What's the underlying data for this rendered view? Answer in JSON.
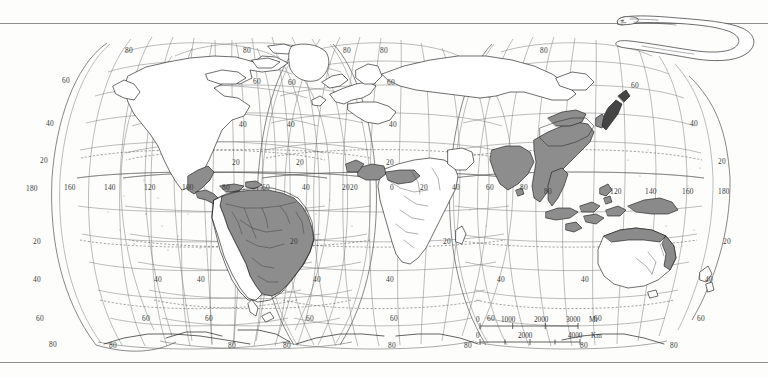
{
  "figure": {
    "kind": "world-distribution-map",
    "projection_name": "interrupted homolosine (Goode-style)",
    "subject_illustration": "eel"
  },
  "scale_bar": {
    "miles": {
      "unit_label": "Mi",
      "ticks": [
        "0",
        "1000",
        "2000",
        "3000"
      ]
    },
    "kilometers": {
      "unit_label": "Km",
      "ticks": [
        "0",
        "2000",
        "4000"
      ]
    }
  },
  "graticule": {
    "latitude_labels": [
      "80",
      "60",
      "40",
      "20",
      "20",
      "40",
      "60",
      "80"
    ],
    "longitude_labels_americas": [
      "180",
      "160",
      "140",
      "120",
      "100",
      "80",
      "60",
      "40",
      "20"
    ],
    "longitude_labels_africa_europe": [
      "20",
      "0",
      "20",
      "40",
      "60",
      "80"
    ],
    "longitude_labels_asia_pacific": [
      "100",
      "120",
      "140",
      "160",
      "180"
    ]
  },
  "labels": {
    "lat_left_60n": "60",
    "lat_left_40n": "40",
    "lat_left_20n": "20",
    "lat_left_20s": "20",
    "lat_left_40s": "40",
    "lat_left_60s": "60",
    "lat_left_80s": "80",
    "l1_80n_a": "80",
    "l1_80n_b": "80",
    "l1_60n_a": "60",
    "l1_60n_b": "60",
    "l1_40n_b": "40",
    "l1_20n_b": "20",
    "l1_40s_a": "40",
    "l1_40s_b": "40",
    "l1_60s_a": "60",
    "l1_60s_b": "60",
    "l1_80s_a": "80",
    "l1_80s_b": "80",
    "l2_80n": "80",
    "l2_60n_a": "60",
    "l2_60n_b": "60",
    "l2_40n_a": "40",
    "l2_40n_b": "40",
    "l2_20n_a": "20",
    "l2_20n_b": "20",
    "l2_20s_a": "20",
    "l2_20s_b": "20",
    "l2_40s_a": "40",
    "l2_40s_b": "40",
    "l2_60s_a": "60",
    "l2_60s_b": "60",
    "l2_80s_a": "80",
    "l2_80s_b": "80",
    "l3_80n": "80",
    "l3_60n": "60",
    "l3_40n": "40",
    "l3_20n": "20",
    "l3_20s": "20",
    "l3_40s": "40",
    "lon_180w": "180",
    "lon_160w": "160",
    "lon_140w": "140",
    "lon_120w": "120",
    "lon_100w": "100",
    "lon_80w": "80",
    "lon_60w": "60",
    "lon_40w": "40",
    "lon_20w": "20",
    "lon_20w_b": "20",
    "lon_0": "0",
    "lon_20e": "20",
    "lon_40e": "40",
    "lon_60e": "60",
    "lon_80e": "80",
    "lon_80e_b": "80",
    "lon_120e": "120",
    "lon_140e": "140",
    "lon_160e": "160",
    "lon_180e": "180",
    "lon_140e_b": "140",
    "lon_160e_b": "160",
    "lon_180e_b": "180",
    "lat_right_40n": "40",
    "lat_right_20n": "20",
    "lat_right_20s": "20",
    "lat_right_40s": "40",
    "lat_right_60n": "60",
    "lat_right_80n": "80"
  },
  "distribution": {
    "shaded_regions": [
      "South America (Amazon and Paraná basins, east of the Andes)",
      "Central America and southern Mexico coasts",
      "West Africa coastal belt (Gulf of Guinea)",
      "South Asia (India, Sri Lanka)",
      "Southeast Asia and southern China",
      "Korea and Japan coastal",
      "Indonesia, Philippines, New Guinea",
      "Northern and eastern Australia coasts"
    ],
    "shade_color": "#8a8a8a",
    "outline_color": "#222222",
    "graticule_color": "#6f6f6f"
  },
  "colors": {
    "background": "#fdfdfc",
    "rule": "#8d8d8d",
    "land_fill": "#ffffff",
    "text": "#3a3a3a"
  }
}
